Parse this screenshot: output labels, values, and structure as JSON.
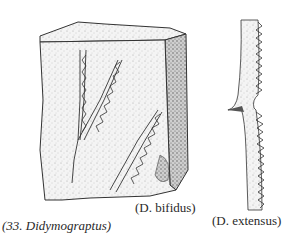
{
  "figure": {
    "caption": "(33. Didymograptus)",
    "specimens": [
      {
        "name": "D. bifidus",
        "label": "(D. bifidus)"
      },
      {
        "name": "D. extensus",
        "label": "(D. extensus)"
      }
    ]
  }
}
